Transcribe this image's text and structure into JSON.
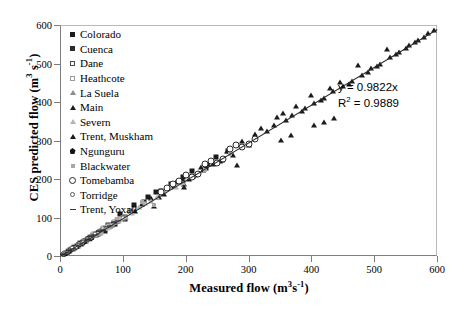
{
  "chart_data": {
    "type": "scatter",
    "title": "",
    "xlabel": "Measured flow (m3 s-1)",
    "ylabel": "CES predicted flow (m3 s-1)",
    "xlim": [
      0,
      600
    ],
    "ylim": [
      0,
      600
    ],
    "xticks": [
      0,
      100,
      200,
      300,
      400,
      500,
      600
    ],
    "yticks": [
      0,
      100,
      200,
      300,
      400,
      500,
      600
    ],
    "grid": false,
    "legend_position": "top-left",
    "annotations": {
      "equation": "y = 0.9822x",
      "r_squared_prefix": "R",
      "r_squared_exponent": "2",
      "r_squared_value": " = 0.9889"
    },
    "trendline": {
      "slope": 0.9822,
      "intercept": 0,
      "r2": 0.9889
    },
    "series": [
      {
        "name": "Colorado",
        "marker": "m-sq-f",
        "points": [
          [
            118,
            132
          ],
          [
            140,
            152
          ],
          [
            103,
            96
          ],
          [
            152,
            166
          ],
          [
            96,
            108
          ],
          [
            176,
            188
          ],
          [
            210,
            222
          ],
          [
            88,
            82
          ],
          [
            248,
            258
          ],
          [
            196,
            205
          ],
          [
            72,
            66
          ],
          [
            133,
            140
          ],
          [
            160,
            170
          ],
          [
            232,
            228
          ],
          [
            268,
            272
          ],
          [
            60,
            56
          ]
        ]
      },
      {
        "name": "Cuenca",
        "marker": "m-sq-f2",
        "points": [
          [
            22,
            20
          ],
          [
            34,
            31
          ],
          [
            45,
            44
          ],
          [
            58,
            55
          ],
          [
            68,
            70
          ],
          [
            80,
            78
          ],
          [
            92,
            90
          ],
          [
            104,
            101
          ],
          [
            28,
            26
          ],
          [
            50,
            49
          ],
          [
            64,
            62
          ],
          [
            76,
            80
          ],
          [
            86,
            84
          ],
          [
            112,
            118
          ],
          [
            40,
            38
          ],
          [
            16,
            15
          ]
        ]
      },
      {
        "name": "Dane",
        "marker": "m-sq-o",
        "points": [
          [
            14,
            13
          ],
          [
            24,
            23
          ],
          [
            32,
            34
          ],
          [
            42,
            40
          ],
          [
            52,
            54
          ],
          [
            62,
            60
          ],
          [
            72,
            74
          ],
          [
            82,
            80
          ],
          [
            90,
            92
          ],
          [
            100,
            98
          ],
          [
            20,
            19
          ],
          [
            36,
            37
          ],
          [
            46,
            45
          ],
          [
            56,
            58
          ],
          [
            66,
            64
          ],
          [
            76,
            78
          ]
        ]
      },
      {
        "name": "Heathcote",
        "marker": "m-sq-o2",
        "points": [
          [
            10,
            9
          ],
          [
            18,
            17
          ],
          [
            26,
            27
          ],
          [
            30,
            29
          ],
          [
            38,
            40
          ],
          [
            44,
            43
          ],
          [
            54,
            56
          ],
          [
            60,
            59
          ],
          [
            70,
            72
          ],
          [
            78,
            76
          ],
          [
            86,
            88
          ],
          [
            94,
            93
          ],
          [
            12,
            12
          ],
          [
            22,
            24
          ],
          [
            34,
            33
          ],
          [
            48,
            50
          ]
        ]
      },
      {
        "name": "La Suela",
        "marker": "m-tri-g",
        "points": [
          [
            8,
            7
          ],
          [
            15,
            16
          ],
          [
            21,
            20
          ],
          [
            27,
            29
          ],
          [
            33,
            32
          ],
          [
            39,
            41
          ],
          [
            47,
            46
          ],
          [
            55,
            57
          ],
          [
            63,
            61
          ],
          [
            71,
            73
          ],
          [
            79,
            77
          ],
          [
            87,
            89
          ],
          [
            11,
            10
          ],
          [
            19,
            21
          ],
          [
            29,
            28
          ],
          [
            43,
            44
          ]
        ]
      },
      {
        "name": "Main",
        "marker": "m-tri-f",
        "points": [
          [
            120,
            118
          ],
          [
            145,
            150
          ],
          [
            165,
            160
          ],
          [
            185,
            192
          ],
          [
            205,
            200
          ],
          [
            225,
            232
          ],
          [
            150,
            131
          ],
          [
            175,
            178
          ],
          [
            195,
            198
          ],
          [
            215,
            210
          ],
          [
            235,
            240
          ],
          [
            255,
            248
          ],
          [
            130,
            136
          ],
          [
            158,
            154
          ],
          [
            178,
            183
          ],
          [
            198,
            188
          ]
        ]
      },
      {
        "name": "Severn",
        "marker": "m-tri-o",
        "points": [
          [
            25,
            26
          ],
          [
            45,
            47
          ],
          [
            65,
            63
          ],
          [
            85,
            88
          ],
          [
            105,
            102
          ],
          [
            125,
            128
          ],
          [
            145,
            142
          ],
          [
            165,
            168
          ],
          [
            185,
            180
          ],
          [
            205,
            208
          ],
          [
            35,
            36
          ],
          [
            55,
            57
          ],
          [
            75,
            73
          ],
          [
            95,
            97
          ],
          [
            115,
            112
          ],
          [
            135,
            138
          ],
          [
            155,
            152
          ],
          [
            175,
            178
          ],
          [
            195,
            190
          ],
          [
            215,
            212
          ]
        ]
      },
      {
        "name": "Trent, Muskham",
        "marker": "m-tri-f",
        "points": [
          [
            290,
            300
          ],
          [
            310,
            318
          ],
          [
            330,
            325
          ],
          [
            345,
            362
          ],
          [
            360,
            352
          ],
          [
            375,
            390
          ],
          [
            390,
            384
          ],
          [
            405,
            398
          ],
          [
            420,
            410
          ],
          [
            435,
            428
          ],
          [
            450,
            442
          ],
          [
            465,
            455
          ],
          [
            480,
            470
          ],
          [
            495,
            488
          ],
          [
            510,
            500
          ],
          [
            525,
            516
          ],
          [
            540,
            530
          ],
          [
            555,
            548
          ],
          [
            570,
            562
          ],
          [
            585,
            578
          ],
          [
            300,
            288
          ],
          [
            320,
            332
          ],
          [
            340,
            340
          ],
          [
            355,
            372
          ],
          [
            370,
            366
          ],
          [
            385,
            376
          ],
          [
            400,
            418
          ],
          [
            415,
            404
          ],
          [
            430,
            436
          ],
          [
            445,
            452
          ],
          [
            460,
            448
          ],
          [
            475,
            496
          ],
          [
            490,
            478
          ],
          [
            505,
            494
          ],
          [
            520,
            538
          ],
          [
            535,
            524
          ],
          [
            550,
            540
          ],
          [
            565,
            556
          ],
          [
            580,
            570
          ],
          [
            595,
            588
          ],
          [
            282,
            236
          ],
          [
            265,
            272
          ],
          [
            275,
            262
          ],
          [
            258,
            250
          ],
          [
            243,
            238
          ],
          [
            228,
            224
          ],
          [
            212,
            208
          ],
          [
            198,
            178
          ],
          [
            352,
            302
          ],
          [
            368,
            314
          ],
          [
            404,
            340
          ],
          [
            420,
            348
          ],
          [
            436,
            358
          ]
        ]
      },
      {
        "name": "Ngunguru",
        "marker": "m-pent-f",
        "points": [
          [
            6,
            6
          ],
          [
            12,
            11
          ],
          [
            18,
            19
          ],
          [
            24,
            23
          ],
          [
            30,
            31
          ],
          [
            36,
            35
          ],
          [
            42,
            43
          ],
          [
            48,
            47
          ],
          [
            9,
            8
          ],
          [
            15,
            14
          ],
          [
            21,
            22
          ],
          [
            27,
            26
          ],
          [
            33,
            34
          ],
          [
            39,
            38
          ],
          [
            45,
            46
          ],
          [
            51,
            50
          ]
        ]
      },
      {
        "name": "Blackwater",
        "marker": "m-sq-g",
        "points": [
          [
            110,
            118
          ],
          [
            150,
            132
          ],
          [
            190,
            198
          ],
          [
            230,
            224
          ],
          [
            130,
            140
          ],
          [
            170,
            176
          ],
          [
            210,
            206
          ],
          [
            250,
            244
          ],
          [
            90,
            96
          ],
          [
            270,
            266
          ],
          [
            290,
            284
          ],
          [
            310,
            302
          ]
        ]
      },
      {
        "name": "Tomebamba",
        "marker": "m-cir-o",
        "points": [
          [
            180,
            186
          ],
          [
            200,
            210
          ],
          [
            220,
            214
          ],
          [
            240,
            248
          ],
          [
            260,
            252
          ],
          [
            280,
            288
          ],
          [
            300,
            292
          ],
          [
            190,
            196
          ],
          [
            210,
            204
          ],
          [
            230,
            238
          ],
          [
            250,
            242
          ],
          [
            270,
            278
          ],
          [
            290,
            282
          ],
          [
            160,
            166
          ],
          [
            170,
            176
          ],
          [
            310,
            304
          ]
        ]
      },
      {
        "name": "Torridge",
        "marker": "m-cir-o-s",
        "points": [
          [
            5,
            5
          ],
          [
            11,
            10
          ],
          [
            17,
            18
          ],
          [
            23,
            22
          ],
          [
            29,
            30
          ],
          [
            35,
            34
          ],
          [
            41,
            42
          ],
          [
            47,
            46
          ],
          [
            53,
            52
          ],
          [
            59,
            60
          ],
          [
            7,
            7
          ],
          [
            13,
            14
          ],
          [
            19,
            20
          ],
          [
            25,
            24
          ],
          [
            31,
            32
          ],
          [
            37,
            38
          ],
          [
            43,
            44
          ],
          [
            49,
            50
          ],
          [
            55,
            56
          ],
          [
            61,
            62
          ]
        ]
      },
      {
        "name": "Trent, Yoxall",
        "marker": "m-dash",
        "points": [
          [
            4,
            4
          ],
          [
            9,
            9
          ],
          [
            14,
            15
          ],
          [
            20,
            19
          ],
          [
            26,
            27
          ],
          [
            32,
            31
          ],
          [
            38,
            39
          ],
          [
            44,
            43
          ],
          [
            50,
            51
          ],
          [
            56,
            55
          ],
          [
            62,
            64
          ],
          [
            68,
            67
          ],
          [
            74,
            76
          ],
          [
            80,
            79
          ],
          [
            86,
            88
          ],
          [
            92,
            91
          ]
        ]
      }
    ]
  },
  "axes": {
    "y_title_main": "CES predicted flow (m",
    "y_title_exp1": "3",
    "y_title_mid": " s",
    "y_title_exp2": "-1",
    "y_title_end": ")",
    "x_title_main": "Measured flow (m",
    "x_title_exp1": "3",
    "x_title_mid": "s",
    "x_title_exp2": "-1",
    "x_title_end": ")"
  }
}
